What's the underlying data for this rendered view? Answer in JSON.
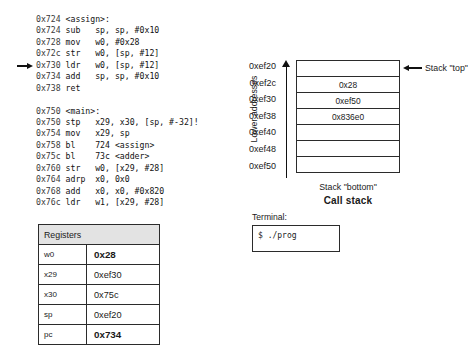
{
  "asm": {
    "lines": [
      {
        "addr": "0x724",
        "text": "<assign>:",
        "current": false
      },
      {
        "addr": "0x724",
        "text": "sub   sp, sp, #0x10",
        "current": false
      },
      {
        "addr": "0x728",
        "text": "mov   w0, #0x28",
        "current": false
      },
      {
        "addr": "0x72c",
        "text": "str   w0, [sp, #12]",
        "current": false
      },
      {
        "addr": "0x730",
        "text": "ldr   w0, [sp, #12]",
        "current": true
      },
      {
        "addr": "0x734",
        "text": "add   sp, sp, #0x10",
        "current": false
      },
      {
        "addr": "0x738",
        "text": "ret",
        "current": false
      },
      {
        "addr": "",
        "text": "",
        "current": false
      },
      {
        "addr": "0x750",
        "text": "<main>:",
        "current": false
      },
      {
        "addr": "0x750",
        "text": "stp   x29, x30, [sp, #-32]!",
        "current": false
      },
      {
        "addr": "0x754",
        "text": "mov   x29, sp",
        "current": false
      },
      {
        "addr": "0x758",
        "text": "bl    724 <assign>",
        "current": false
      },
      {
        "addr": "0x75c",
        "text": "bl    73c <adder>",
        "current": false
      },
      {
        "addr": "0x760",
        "text": "str   w0, [x29, #28]",
        "current": false
      },
      {
        "addr": "0x764",
        "text": "adrp  x0, 0x0",
        "current": false
      },
      {
        "addr": "0x768",
        "text": "add   x0, x0, #0x820",
        "current": false
      },
      {
        "addr": "0x76c",
        "text": "ldr   w1, [x29, #28]",
        "current": false
      }
    ],
    "pc_marker": "pc-arrow-icon"
  },
  "registers": {
    "header": "Registers",
    "rows": [
      {
        "name": "w0",
        "value": "0x28",
        "bold": true
      },
      {
        "name": "x29",
        "value": "0xef30",
        "bold": false
      },
      {
        "name": "x30",
        "value": "0x75c",
        "bold": false
      },
      {
        "name": "sp",
        "value": "0xef20",
        "bold": false
      },
      {
        "name": "pc",
        "value": "0x734",
        "bold": true
      }
    ]
  },
  "callstack": {
    "caption": "Call stack",
    "axis_label": "Lower addresses",
    "top_annotation": "Stack \"top\"",
    "bottom_label": "Stack \"bottom\"",
    "addresses": [
      "0xef20",
      "0xef2c",
      "0xef30",
      "0xef38",
      "0xef40",
      "0xef48",
      "0xef50"
    ],
    "cells": [
      "",
      "0x28",
      "0xef50",
      "0x836e0",
      "",
      "",
      ""
    ]
  },
  "terminal": {
    "label": "Terminal:",
    "line": "$ ./prog"
  }
}
